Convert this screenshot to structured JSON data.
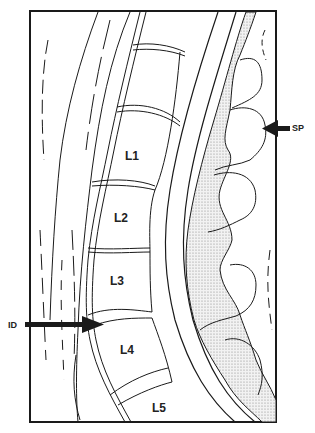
{
  "figure": {
    "type": "sagittal lumbar spine line drawing",
    "colors": {
      "line": "#1a1a1a",
      "stipple": "#c8c8c8",
      "background": "#ffffff"
    }
  },
  "vertebrae": [
    {
      "label": "L1"
    },
    {
      "label": "L2"
    },
    {
      "label": "L3"
    },
    {
      "label": "L4"
    },
    {
      "label": "L5"
    }
  ],
  "annotations": [
    {
      "label": "ID",
      "side": "left",
      "points_to": "L3-L4 intervertebral disc"
    },
    {
      "label": "SP",
      "side": "right",
      "points_to": "spinous process"
    }
  ]
}
